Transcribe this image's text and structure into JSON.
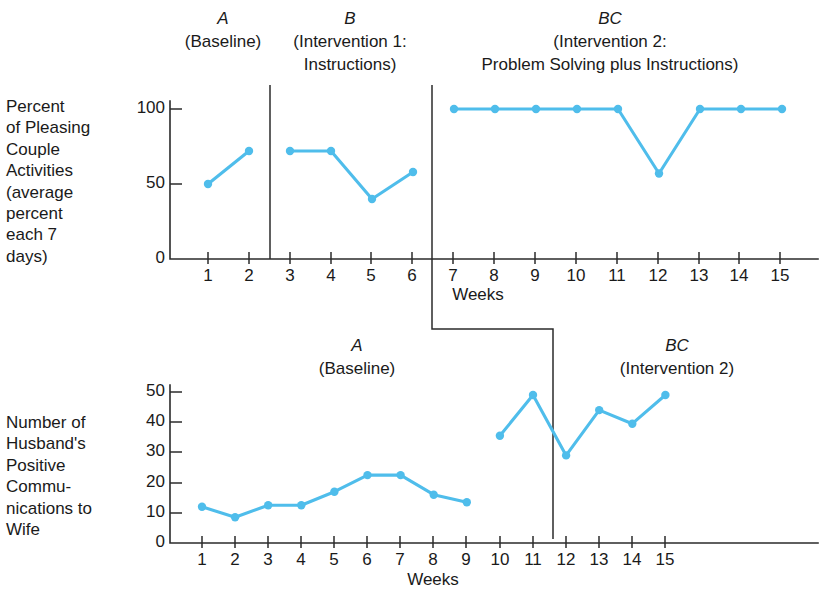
{
  "figure": {
    "background_color": "#ffffff",
    "line_color": "#4fbdeb",
    "axis_color": "#2b2b2b"
  },
  "chart_data": [
    {
      "id": "top-panel",
      "type": "line",
      "title": "",
      "xlabel": "Weeks",
      "ylabel": "Percent of Pleasing Couple Activities (average percent each 7 days)",
      "ylabel_lines": "Percent\nof Pleasing\nCouple\nActivities\n(average\npercent\neach 7\ndays)",
      "x": [
        1,
        2,
        3,
        4,
        5,
        6,
        7,
        8,
        9,
        10,
        11,
        12,
        13,
        14,
        15
      ],
      "values": [
        50,
        72,
        72,
        72,
        40,
        58,
        100,
        100,
        100,
        100,
        100,
        57,
        100,
        100,
        100
      ],
      "xticks": [
        "1",
        "2",
        "3",
        "4",
        "5",
        "6",
        "7",
        "8",
        "9",
        "10",
        "11",
        "12",
        "13",
        "14",
        "15"
      ],
      "yticks": [
        "0",
        "50",
        "100"
      ],
      "ytick_values": [
        0,
        50,
        100
      ],
      "ylim": [
        0,
        112
      ],
      "xlim": [
        0.35,
        15.6
      ],
      "grid": false,
      "legend": "none",
      "segments": [
        {
          "phase": "A",
          "x_from": 1,
          "x_to": 2
        },
        {
          "phase": "B",
          "x_from": 3,
          "x_to": 6
        },
        {
          "phase": "BC",
          "x_from": 7,
          "x_to": 15
        }
      ],
      "phase_dividers": [
        2.5,
        6.5
      ],
      "phases": [
        {
          "letter": "A",
          "description_lines": [
            "(Baseline)"
          ],
          "center_x": 1.5
        },
        {
          "letter": "B",
          "description_lines": [
            "(Intervention 1:",
            "Instructions)"
          ],
          "center_x": 4.5
        },
        {
          "letter": "BC",
          "description_lines": [
            "(Intervention 2:",
            "Problem Solving plus Instructions)"
          ],
          "center_x": 11.0
        }
      ]
    },
    {
      "id": "bottom-panel",
      "type": "line",
      "title": "",
      "xlabel": "Weeks",
      "ylabel": "Number of Husband's Positive Communications to Wife",
      "ylabel_lines": "Number of\nHusband's\nPositive\nCommu-\nnications to\nWife",
      "x": [
        1,
        2,
        3,
        4,
        5,
        6,
        7,
        8,
        9,
        10,
        11,
        12,
        13,
        14,
        15
      ],
      "values": [
        12,
        8.5,
        12.5,
        12.5,
        17,
        22.5,
        22.5,
        16,
        13.5,
        35.5,
        49,
        29,
        44,
        39.5,
        49
      ],
      "xticks": [
        "1",
        "2",
        "3",
        "4",
        "5",
        "6",
        "7",
        "8",
        "9",
        "10",
        "11",
        "12",
        "13",
        "14",
        "15"
      ],
      "yticks": [
        "0",
        "10",
        "20",
        "30",
        "40",
        "50"
      ],
      "ytick_values": [
        0,
        10,
        20,
        30,
        40,
        50
      ],
      "ylim": [
        0,
        56
      ],
      "xlim": [
        0.35,
        15.6
      ],
      "grid": false,
      "legend": "none",
      "segments": [
        {
          "phase": "A",
          "x_from": 1,
          "x_to": 9
        },
        {
          "phase": "BC",
          "x_from": 10,
          "x_to": 15
        }
      ],
      "phase_dividers": [
        9.5
      ],
      "phases": [
        {
          "letter": "A",
          "description_lines": [
            "(Baseline)"
          ],
          "center_x": 5.0
        },
        {
          "letter": "BC",
          "description_lines": [
            "(Intervention 2)"
          ],
          "center_x": 12.5
        }
      ]
    }
  ],
  "top": {
    "caption": "Percent\nof Pleasing\nCouple\nActivities\n(average\npercent\neach 7\ndays)",
    "xaxis_title": "Weeks",
    "ytick_0": "0",
    "ytick_50": "50",
    "ytick_100": "100",
    "phase_a_letter": "A",
    "phase_a_desc1": "(Baseline)",
    "phase_b_letter": "B",
    "phase_b_desc1": "(Intervention 1:",
    "phase_b_desc2": "Instructions)",
    "phase_bc_letter": "BC",
    "phase_bc_desc1": "(Intervention 2:",
    "phase_bc_desc2": "Problem Solving plus Instructions)",
    "xtick_1": "1",
    "xtick_2": "2",
    "xtick_3": "3",
    "xtick_4": "4",
    "xtick_5": "5",
    "xtick_6": "6",
    "xtick_7": "7",
    "xtick_8": "8",
    "xtick_9": "9",
    "xtick_10": "10",
    "xtick_11": "11",
    "xtick_12": "12",
    "xtick_13": "13",
    "xtick_14": "14",
    "xtick_15": "15"
  },
  "bottom": {
    "caption": "Number of\nHusband's\nPositive\nCommu-\nnications to\nWife",
    "xaxis_title": "Weeks",
    "ytick_0": "0",
    "ytick_10": "10",
    "ytick_20": "20",
    "ytick_30": "30",
    "ytick_40": "40",
    "ytick_50": "50",
    "phase_a_letter": "A",
    "phase_a_desc1": "(Baseline)",
    "phase_bc_letter": "BC",
    "phase_bc_desc1": "(Intervention 2)",
    "xtick_1": "1",
    "xtick_2": "2",
    "xtick_3": "3",
    "xtick_4": "4",
    "xtick_5": "5",
    "xtick_6": "6",
    "xtick_7": "7",
    "xtick_8": "8",
    "xtick_9": "9",
    "xtick_10": "10",
    "xtick_11": "11",
    "xtick_12": "12",
    "xtick_13": "13",
    "xtick_14": "14",
    "xtick_15": "15"
  }
}
